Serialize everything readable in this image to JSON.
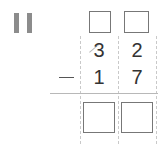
{
  "problem": {
    "number_label": "II",
    "operation": "subtraction",
    "operator_symbol": "−",
    "minuend": {
      "tens": "3",
      "ones": "2"
    },
    "subtrahend": {
      "tens": "1",
      "ones": "7"
    },
    "regroup_boxes": [
      {
        "position": "tens",
        "value": ""
      },
      {
        "position": "ones",
        "value": ""
      }
    ],
    "answer_boxes": [
      {
        "position": "tens",
        "value": ""
      },
      {
        "position": "ones",
        "value": ""
      }
    ]
  },
  "colors": {
    "roman_numeral": "#8a8a8a",
    "digits": "#333333",
    "box_border": "#777777",
    "dashed_guides": "#c9c9c9",
    "rule_line": "#b8b8b8"
  }
}
